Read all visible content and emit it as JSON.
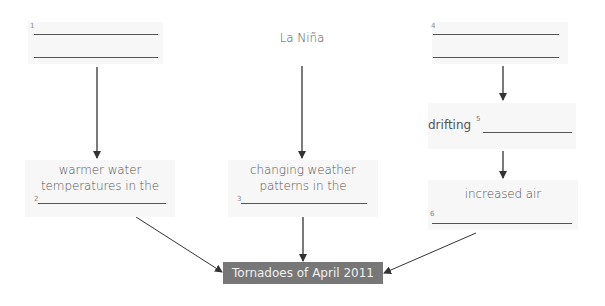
{
  "diagram": {
    "type": "cause-effect flowchart",
    "columns": [
      {
        "top": {
          "blank_number": "1",
          "text": ""
        },
        "middle": {
          "text_line1": "warmer water",
          "text_line2": "temperatures in the",
          "blank_number": "2"
        }
      },
      {
        "top": {
          "text": "La Niña"
        },
        "middle": {
          "text_line1": "changing weather",
          "text_line2": "patterns in the",
          "blank_number": "3"
        }
      },
      {
        "top": {
          "blank_number": "4",
          "text": ""
        },
        "middle": {
          "text": "drifting",
          "blank_number": "5"
        },
        "lower": {
          "text": "increased air",
          "blank_number": "6"
        }
      }
    ],
    "result": {
      "text": "Tornadoes of April 2011"
    },
    "colors": {
      "box_background": "#f7f7f7",
      "result_background": "#777777",
      "result_text": "#f0f0f0",
      "text": "#555555",
      "arrow": "#333333"
    }
  }
}
